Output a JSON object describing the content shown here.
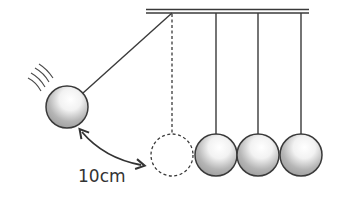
{
  "diagram": {
    "distance_label": "10cm",
    "colors": {
      "stroke": "#3a3a3a",
      "ball_fill_light": "#ffffff",
      "ball_fill_dark": "#9a9a9a",
      "background": "#ffffff"
    },
    "elements": {
      "support_bar": "top horizontal bar",
      "swung_ball": "ball pulled back to the left",
      "rest_position": "dashed outline of swung ball at rest",
      "hanging_balls_count": 3,
      "distance_arrow": "double-headed curved arrow"
    }
  }
}
